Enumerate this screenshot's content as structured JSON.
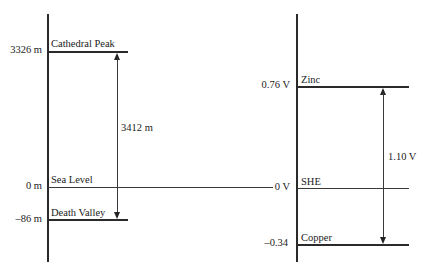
{
  "left_diagram": {
    "levels": [
      {
        "value_label": "3326 m",
        "name": "Cathedral Peak"
      },
      {
        "value_label": "0 m",
        "name": "Sea Level"
      },
      {
        "value_label": "–86 m",
        "name": "Death Valley"
      }
    ],
    "difference_label": "3412 m"
  },
  "right_diagram": {
    "levels": [
      {
        "value_label": "0.76 V",
        "name": "Zinc"
      },
      {
        "value_label": "0 V",
        "name": "SHE"
      },
      {
        "value_label": "–0.34",
        "name": "Copper"
      }
    ],
    "difference_label": "1.10 V"
  },
  "colors": {
    "line": "#2a2a2a",
    "text": "#222222",
    "background": "#ffffff"
  }
}
